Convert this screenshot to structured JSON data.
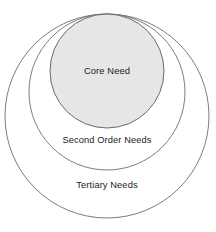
{
  "diagram": {
    "type": "nested-circles",
    "background_color": "#ffffff",
    "rings": [
      {
        "id": "tertiary",
        "label": "Tertiary Needs",
        "level": 3,
        "fill": "none",
        "stroke": "#6e6e6e",
        "cx": 107,
        "cy": 116,
        "r": 102
      },
      {
        "id": "second-order",
        "label": "Second Order Needs",
        "level": 2,
        "fill": "none",
        "stroke": "#6e6e6e",
        "cx": 107,
        "cy": 92,
        "r": 78
      },
      {
        "id": "core",
        "label": "Core Need",
        "level": 1,
        "fill": "#e6e6e6",
        "stroke": "#6a6a6a",
        "cx": 107,
        "cy": 71,
        "r": 57
      }
    ],
    "labels": {
      "core": "Core Need",
      "second_order": "Second Order Needs",
      "tertiary": "Tertiary Needs"
    }
  }
}
